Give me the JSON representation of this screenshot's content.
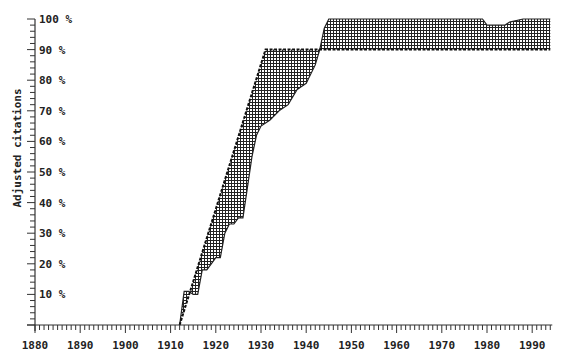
{
  "chart_data": {
    "type": "area",
    "title": "",
    "xlabel": "",
    "ylabel": "Adjusted citations",
    "xlim": [
      1880,
      1994
    ],
    "ylim": [
      0,
      100
    ],
    "grid": false,
    "legend": null,
    "x_ticks": [
      "1880",
      "1890",
      "1900",
      "1910",
      "1920",
      "1930",
      "1940",
      "1950",
      "1960",
      "1970",
      "1980",
      "1990"
    ],
    "y_ticks": [
      "10 %",
      "20 %",
      "30 %",
      "40 %",
      "50 %",
      "60 %",
      "70 %",
      "80 %",
      "90 %",
      "100 %"
    ],
    "fill_pattern": "crosshatch",
    "series": [
      {
        "name": "upper bound (dashed)",
        "x": [
          1912,
          1931,
          1943,
          1994
        ],
        "values": [
          0,
          90,
          90,
          90
        ]
      },
      {
        "name": "lower bound",
        "x": [
          1912,
          1913,
          1914,
          1915,
          1916,
          1917,
          1918,
          1919,
          1920,
          1921,
          1922,
          1923,
          1924,
          1925,
          1926,
          1927,
          1928,
          1929,
          1930,
          1931,
          1932,
          1934,
          1936,
          1938,
          1940,
          1942,
          1943,
          1944,
          1945,
          1979,
          1980,
          1984,
          1985,
          1988,
          1994
        ],
        "values": [
          0,
          11,
          11,
          10,
          10,
          18,
          18,
          20,
          22,
          22,
          30,
          33,
          33,
          35,
          35,
          45,
          55,
          62,
          65,
          66,
          67,
          70,
          72,
          77,
          79,
          85,
          90,
          97,
          100,
          100,
          98,
          98,
          99,
          100,
          100
        ]
      }
    ]
  }
}
